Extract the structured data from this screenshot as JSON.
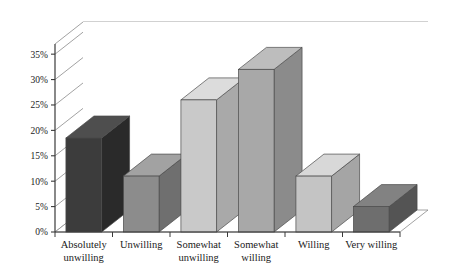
{
  "chart_data": {
    "type": "bar",
    "title": "",
    "subtitle": "",
    "xlabel": "",
    "ylabel": "",
    "categories": [
      "Absolutely unwilling",
      "Unwilling",
      "Somewhat unwilling",
      "Somewhat willing",
      "Willing",
      "Very willing"
    ],
    "category_lines": [
      [
        "Absolutely",
        "unwilling"
      ],
      [
        "Unwilling",
        ""
      ],
      [
        "Somewhat",
        "unwilling"
      ],
      [
        "Somewhat",
        "willing"
      ],
      [
        "Willing",
        ""
      ],
      [
        "Very willing",
        ""
      ]
    ],
    "values": [
      18.5,
      11,
      26,
      32,
      11,
      5
    ],
    "value_labels": [
      "18.5%",
      "11%",
      "26%",
      "32%",
      "11%",
      "5%"
    ],
    "ylim": [
      0,
      37
    ],
    "yticks": [
      0,
      5,
      10,
      15,
      20,
      25,
      30,
      35
    ],
    "ytick_labels": [
      "0%",
      "5%",
      "10%",
      "15%",
      "20%",
      "25%",
      "30%",
      "35%"
    ],
    "grid": true,
    "legend": "none",
    "style": "3d-perspective-column",
    "bar_colors": [
      "#3c3c3c",
      "#8c8c8c",
      "#c9c9c9",
      "#a8a8a8",
      "#c4c4c4",
      "#6e6e6e"
    ],
    "bar_side_colors": [
      "#2a2a2a",
      "#6f6f6f",
      "#a9a9a9",
      "#8b8b8b",
      "#a5a5a5",
      "#545454"
    ],
    "bar_top_colors": [
      "#4e4e4e",
      "#a2a2a2",
      "#dcdcdc",
      "#bdbdbd",
      "#d8d8d8",
      "#828282"
    ],
    "axis_color": "#555555",
    "grid_color": "#8a8a8a",
    "floor_color": "#ffffff",
    "background_color": "#ffffff"
  }
}
